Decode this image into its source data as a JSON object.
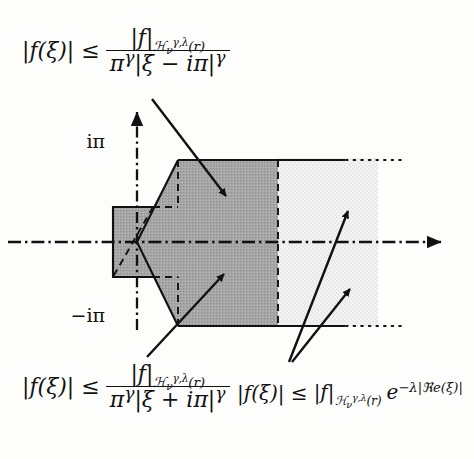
{
  "figure": {
    "axis": {
      "horizontal_label": "",
      "vertical_label": "",
      "upper_tick_label": "iπ",
      "lower_tick_label": "−iπ"
    },
    "regions": [
      {
        "name": "dark-shaded-region",
        "fill": "#a0a0a0"
      },
      {
        "name": "light-shaded-region",
        "fill": "#e8e8e8"
      }
    ],
    "colors": {
      "dark_fill": "#a0a0a0",
      "light_fill": "#e9e9e9",
      "stroke": "#111111",
      "background": "#fdfdfc"
    }
  },
  "formulas": {
    "top_left": {
      "lhs": "|f(ξ)| ≤",
      "numerator_norm": "|f|",
      "numerator_sub_space": "ℋ",
      "numerator_sub_index": "ν",
      "numerator_sup_index": "γ,λ",
      "numerator_arg": "(r)",
      "denominator": "πγ|ξ − iπ|γ",
      "denominator_base1": "π",
      "denominator_exp1": "γ",
      "denominator_mid": "|ξ − iπ|",
      "denominator_exp2": "γ"
    },
    "bottom_left": {
      "lhs": "|f(ξ)| ≤",
      "numerator_norm": "|f|",
      "numerator_sub_space": "ℋ",
      "numerator_sub_index": "ν",
      "numerator_sup_index": "γ,λ",
      "numerator_arg": "(r)",
      "denominator_base1": "π",
      "denominator_exp1": "γ",
      "denominator_mid": "|ξ + iπ|",
      "denominator_exp2": "γ"
    },
    "bottom_right": {
      "lhs": "|f(ξ)| ≤",
      "norm": "|f|",
      "sub_space": "ℋ",
      "sub_index": "ν",
      "sup_index": "γ,λ",
      "arg": "(r)",
      "exponential_base": "e",
      "exponential_power": "−λ|ℜe(ξ)|"
    }
  },
  "annotations": {
    "arrow_top_left": "points-to-dark-region-upper",
    "arrow_bottom_left": "points-to-dark-region-lower",
    "arrow_right_upper": "points-to-light-region-upper",
    "arrow_right_lower": "points-to-light-region-lower"
  }
}
